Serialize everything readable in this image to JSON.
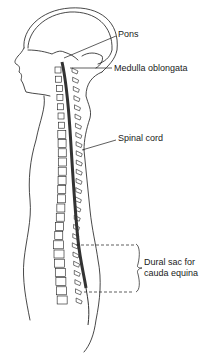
{
  "figure": {
    "labels": {
      "pons": "Pons",
      "medulla": "Medulla oblongata",
      "spinal_cord": "Spinal cord",
      "dural_sac_line1": "Dural sac for",
      "dural_sac_line2": "cauda equina"
    },
    "colors": {
      "line": "#1a1a1a",
      "cord": "#333333",
      "background": "#ffffff"
    }
  }
}
